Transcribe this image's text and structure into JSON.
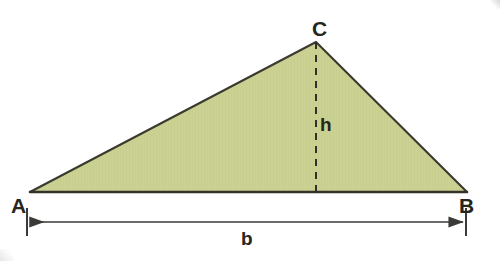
{
  "figure": {
    "background_color": "#ffffff",
    "fill_color": "#cbd193",
    "outline_color": "#3a3a2e",
    "dimension_color": "#3a3a38",
    "label_color": "#26261c"
  },
  "triangle": {
    "vertices": [
      {
        "name": "A",
        "label": "A",
        "x": 30,
        "y": 192
      },
      {
        "name": "B",
        "label": "B",
        "x": 467,
        "y": 192
      },
      {
        "name": "C",
        "label": "C",
        "x": 316,
        "y": 42
      }
    ],
    "polygon_points": "30,192 316,42 467,192"
  },
  "height": {
    "label": "h",
    "from": {
      "x": 316,
      "y": 42
    },
    "to": {
      "x": 316,
      "y": 192
    },
    "style": "dashed",
    "dash_pattern": "7 6"
  },
  "base": {
    "label": "b",
    "dimension_line_y": 222,
    "from_x": 27,
    "to_x": 466,
    "tick_top_y": 208,
    "tick_bottom_y": 236,
    "arrow_style": "double-headed"
  },
  "labels": {
    "vertex_a": "A",
    "vertex_b": "B",
    "vertex_c": "C",
    "height": "h",
    "base": "b"
  }
}
